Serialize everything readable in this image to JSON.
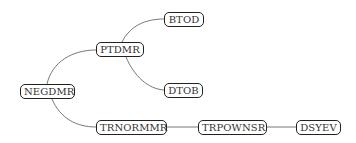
{
  "diagram": {
    "type": "tree",
    "nodes": [
      {
        "id": "NEGDMR",
        "label": "NEGDMR"
      },
      {
        "id": "PTDMR",
        "label": "PTDMR"
      },
      {
        "id": "BTOD",
        "label": "BTOD"
      },
      {
        "id": "DTOB",
        "label": "DTOB"
      },
      {
        "id": "TRNORMMR",
        "label": "TRNORMMR"
      },
      {
        "id": "TRPOWNSR",
        "label": "TRPOWNSR"
      },
      {
        "id": "DSYEV",
        "label": "DSYEV"
      }
    ],
    "edges": [
      {
        "from": "NEGDMR",
        "to": "PTDMR"
      },
      {
        "from": "PTDMR",
        "to": "BTOD"
      },
      {
        "from": "PTDMR",
        "to": "DTOB"
      },
      {
        "from": "NEGDMR",
        "to": "TRNORMMR"
      },
      {
        "from": "TRNORMMR",
        "to": "TRPOWNSR"
      },
      {
        "from": "TRPOWNSR",
        "to": "DSYEV"
      }
    ]
  },
  "colors": {
    "edge": "#555555",
    "node_border": "#222222",
    "text": "#333333"
  }
}
